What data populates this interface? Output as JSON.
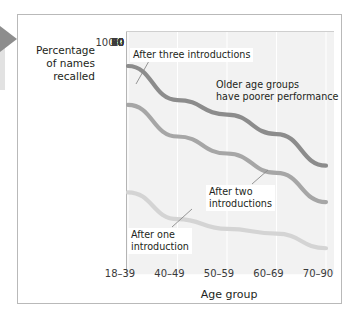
{
  "figure": {
    "pointer_icon": "left-triangle-pointer"
  },
  "axes": {
    "y_title": "Percentage\nof names\nrecalled",
    "y_title_lines": [
      "Percentage",
      "of names",
      "recalled"
    ],
    "x_title": "Age group",
    "y_ticks": [
      "100%",
      "90",
      "80",
      "70",
      "60",
      "50",
      "40",
      "30",
      "20",
      "10",
      "0"
    ],
    "x_ticks": [
      "18–39",
      "40–49",
      "50–59",
      "60–69",
      "70–90"
    ]
  },
  "annotations": {
    "three": "After three introductions",
    "older_line1": "Older age groups",
    "older_line2": "have poorer performance",
    "two_line1": "After two",
    "two_line2": "introductions",
    "one_line1": "After one",
    "one_line2": "introduction"
  },
  "colors": {
    "line_three": "#8c8c8c",
    "line_two": "#a6a6a6",
    "line_one": "#d4d4d4",
    "plot_bg": "#f2f2f2",
    "gridline": "#ffffff",
    "axis": "#9a9a9a",
    "text": "#231f20",
    "pointer": "#8d8d8d"
  },
  "chart_data": {
    "type": "line",
    "title": "",
    "xlabel": "Age group",
    "ylabel": "Percentage of names recalled",
    "categories": [
      "18–39",
      "40–49",
      "50–59",
      "60–69",
      "70–90"
    ],
    "ylim": [
      0,
      100
    ],
    "ytick_step": 10,
    "grid": true,
    "legend": "annotations-inline",
    "series": [
      {
        "name": "After three introductions",
        "color": "#8c8c8c",
        "values": [
          86,
          72,
          66,
          58,
          45
        ]
      },
      {
        "name": "After two introductions",
        "color": "#a6a6a6",
        "values": [
          70,
          57,
          50,
          42,
          30
        ]
      },
      {
        "name": "After one introduction",
        "color": "#d4d4d4",
        "values": [
          34,
          23,
          19,
          17,
          11
        ]
      }
    ],
    "annotations": [
      "After three introductions",
      "Older age groups have poorer performance",
      "After two introductions",
      "After one introduction"
    ]
  }
}
